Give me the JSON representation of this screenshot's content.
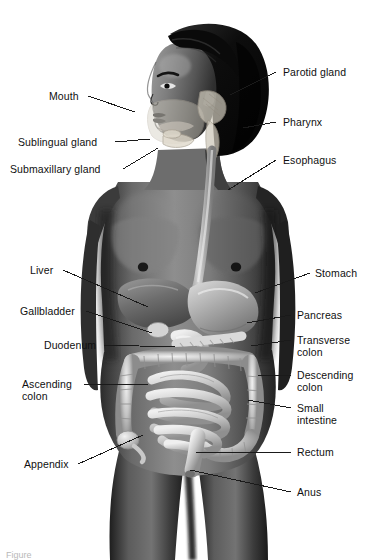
{
  "figure": {
    "background_color": "#ffffff",
    "label_color": "#101010",
    "leader_color": "#1a1a1a",
    "caption_fragment": "Figure"
  },
  "subject": {
    "description": "Grayscale anatomical illustration of a standing woman, head turned in profile to the left, with the digestive tract rendered over the torso",
    "skin_tone_dark": "#3a3a3a",
    "skin_tone_mid": "#6e6e6e",
    "skin_tone_light": "#9a9a9a",
    "hair_color": "#111111",
    "organ_light": "#e8e8e8",
    "organ_mid": "#bdbdbd",
    "organ_shadow": "#8a8a8a"
  },
  "labels": [
    {
      "id": "mouth",
      "text": "Mouth",
      "side": "left",
      "x": 49,
      "y": 90,
      "line": [
        [
          88,
          96
        ],
        [
          135,
          112
        ]
      ]
    },
    {
      "id": "sublingual",
      "text": "Sublingual gland",
      "side": "left",
      "x": 18,
      "y": 136,
      "line": [
        [
          115,
          142
        ],
        [
          150,
          139
        ]
      ]
    },
    {
      "id": "submaxillary",
      "text": "Submaxillary gland",
      "side": "left",
      "x": 10,
      "y": 163,
      "line": [
        [
          123,
          169
        ],
        [
          158,
          148
        ]
      ]
    },
    {
      "id": "parotid-gland",
      "text": "Parotid gland",
      "side": "right",
      "x": 283,
      "y": 66,
      "line": [
        [
          276,
          72
        ],
        [
          230,
          95
        ]
      ]
    },
    {
      "id": "pharynx",
      "text": "Pharynx",
      "side": "right",
      "x": 283,
      "y": 116,
      "line": [
        [
          276,
          122
        ],
        [
          243,
          128
        ]
      ]
    },
    {
      "id": "esophagus",
      "text": "Esophagus",
      "side": "right",
      "x": 283,
      "y": 154,
      "line": [
        [
          276,
          160
        ],
        [
          228,
          190
        ]
      ]
    },
    {
      "id": "liver",
      "text": "Liver",
      "side": "left",
      "x": 30,
      "y": 264,
      "line": [
        [
          63,
          270
        ],
        [
          148,
          307
        ]
      ]
    },
    {
      "id": "gallbladder",
      "text": "Gallbladder",
      "side": "left",
      "x": 20,
      "y": 305,
      "line": [
        [
          86,
          311
        ],
        [
          152,
          333
        ]
      ]
    },
    {
      "id": "duodenum",
      "text": "Duodenum",
      "side": "left",
      "x": 44,
      "y": 339,
      "line": [
        [
          103,
          345
        ],
        [
          175,
          347
        ]
      ]
    },
    {
      "id": "ascending-colon",
      "text": "Ascending\ncolon",
      "side": "left",
      "x": 22,
      "y": 378,
      "line": [
        [
          84,
          384
        ],
        [
          148,
          384
        ]
      ]
    },
    {
      "id": "appendix",
      "text": "Appendix",
      "side": "left",
      "x": 24,
      "y": 458,
      "line": [
        [
          78,
          464
        ],
        [
          143,
          435
        ]
      ]
    },
    {
      "id": "stomach",
      "text": "Stomach",
      "side": "right",
      "x": 315,
      "y": 267,
      "line": [
        [
          310,
          273
        ],
        [
          255,
          293
        ]
      ]
    },
    {
      "id": "pancreas",
      "text": "Pancreas",
      "side": "right",
      "x": 297,
      "y": 309,
      "line": [
        [
          291,
          315
        ],
        [
          247,
          323
        ]
      ]
    },
    {
      "id": "transverse-colon",
      "text": "Transverse\ncolon",
      "side": "right",
      "x": 297,
      "y": 334,
      "line": [
        [
          291,
          340
        ],
        [
          251,
          346
        ]
      ]
    },
    {
      "id": "descending-colon",
      "text": "Descending\ncolon",
      "side": "right",
      "x": 297,
      "y": 369,
      "line": [
        [
          291,
          375
        ],
        [
          258,
          375
        ]
      ]
    },
    {
      "id": "small-intestine",
      "text": "Small\nintestine",
      "side": "right",
      "x": 297,
      "y": 402,
      "line": [
        [
          291,
          408
        ],
        [
          248,
          400
        ]
      ]
    },
    {
      "id": "rectum",
      "text": "Rectum",
      "side": "right",
      "x": 297,
      "y": 446,
      "line": [
        [
          291,
          452
        ],
        [
          196,
          452
        ]
      ]
    },
    {
      "id": "anus",
      "text": "Anus",
      "side": "right",
      "x": 297,
      "y": 486,
      "line": [
        [
          291,
          492
        ],
        [
          190,
          470
        ]
      ]
    }
  ]
}
